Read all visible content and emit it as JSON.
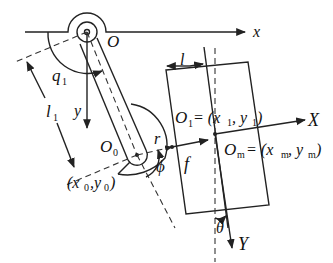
{
  "diagram": {
    "labels": {
      "origin": "O",
      "x_axis": "x",
      "y_axis": "y",
      "joint_angle": "q",
      "joint_angle_sub": "1",
      "link_length": "l",
      "link_length_sub": "1",
      "joint_point": "O",
      "joint_point_sub": "0",
      "joint_coords": "(x",
      "joint_coords_sub0a": "0",
      "joint_coords_mid": ",y",
      "joint_coords_sub0b": "0",
      "joint_coords_close": ")",
      "radius": "r",
      "angle_phi": "ϕ",
      "force": "f",
      "offset": "l",
      "contact_point": "O",
      "contact_point_sub": "1",
      "contact_eq": "= (x",
      "contact_sub_x": "1",
      "contact_mid": ", y",
      "contact_sub_y": "1",
      "contact_close": ")",
      "mass_center": "O",
      "mass_center_sub": "m",
      "mass_eq": "= (x",
      "mass_sub_x": "m",
      "mass_mid": ", y",
      "mass_sub_y": "m",
      "mass_close": ")",
      "body_x_axis": "X",
      "body_y_axis": "Y",
      "body_angle": "θ"
    },
    "colors": {
      "stroke": "#222222",
      "background": "#ffffff"
    }
  }
}
